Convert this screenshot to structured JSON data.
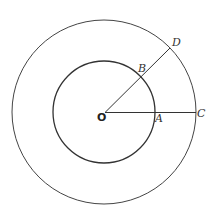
{
  "diagram": {
    "center": {
      "label": "O"
    },
    "points": {
      "A": {
        "label": "A"
      },
      "B": {
        "label": "B"
      },
      "C": {
        "label": "C"
      },
      "D": {
        "label": "D"
      }
    },
    "circles": [
      {
        "name": "inner",
        "passes_through": [
          "A",
          "B"
        ]
      },
      {
        "name": "outer",
        "passes_through": [
          "C",
          "D"
        ]
      }
    ],
    "segments": [
      {
        "from": "O",
        "to": "C",
        "through": "A"
      },
      {
        "from": "O",
        "to": "D",
        "through": "B"
      }
    ],
    "colors": {
      "stroke": "#333333",
      "background": "#ffffff"
    }
  }
}
